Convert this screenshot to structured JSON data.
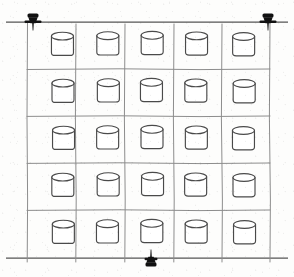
{
  "figure": {
    "kind": "technical-line-drawing",
    "background_color": "#fdfdfc",
    "ink_color": "#3a3a3a",
    "gridline_color": "#8d8d8d",
    "marker_color": "#111111",
    "canvas": {
      "width": 294,
      "height": 277
    }
  },
  "grid": {
    "rows": 5,
    "columns": 5,
    "cell_count": 25,
    "left": 27,
    "top": 22,
    "right": 270,
    "bottom": 258,
    "column_x": [
      27,
      76,
      125,
      174,
      222,
      270
    ],
    "row_y": [
      22,
      69,
      116,
      163,
      210,
      258
    ],
    "stroke_width": 1
  },
  "datum_lines": {
    "top_rule": {
      "x1": 6,
      "y1": 22,
      "x2": 288,
      "y2": 22,
      "label": "top datum line"
    },
    "bottom_rule": {
      "x1": 6,
      "y1": 258,
      "x2": 288,
      "y2": 258,
      "label": "bottom datum line"
    }
  },
  "markers": [
    {
      "id": "pin-top-left",
      "name": "thumbtack marker top left",
      "x": 33,
      "y": 22,
      "orientation": "down"
    },
    {
      "id": "pin-top-right",
      "name": "thumbtack marker top right",
      "x": 268,
      "y": 22,
      "orientation": "down"
    },
    {
      "id": "pin-bottom-center",
      "name": "thumbtack marker bottom center",
      "x": 151,
      "y": 258,
      "orientation": "up"
    }
  ],
  "cylinders": {
    "count": 25,
    "body_width": 22,
    "body_height": 19,
    "ellipse_ry": 4,
    "stroke_color": "#4a4a4a",
    "fill_color": "#ffffff",
    "positions": [
      {
        "row": 1,
        "col": 1,
        "cx": 63,
        "cy": 46
      },
      {
        "row": 1,
        "col": 2,
        "cx": 108,
        "cy": 45
      },
      {
        "row": 1,
        "col": 3,
        "cx": 152,
        "cy": 45
      },
      {
        "row": 1,
        "col": 4,
        "cx": 196,
        "cy": 45
      },
      {
        "row": 1,
        "col": 5,
        "cx": 244,
        "cy": 46
      },
      {
        "row": 2,
        "col": 1,
        "cx": 63,
        "cy": 93
      },
      {
        "row": 2,
        "col": 2,
        "cx": 108,
        "cy": 92
      },
      {
        "row": 2,
        "col": 3,
        "cx": 152,
        "cy": 92
      },
      {
        "row": 2,
        "col": 4,
        "cx": 196,
        "cy": 92
      },
      {
        "row": 2,
        "col": 5,
        "cx": 244,
        "cy": 93
      },
      {
        "row": 3,
        "col": 1,
        "cx": 63,
        "cy": 140
      },
      {
        "row": 3,
        "col": 2,
        "cx": 108,
        "cy": 139
      },
      {
        "row": 3,
        "col": 3,
        "cx": 152,
        "cy": 139
      },
      {
        "row": 3,
        "col": 4,
        "cx": 196,
        "cy": 139
      },
      {
        "row": 3,
        "col": 5,
        "cx": 244,
        "cy": 140
      },
      {
        "row": 4,
        "col": 1,
        "cx": 63,
        "cy": 187
      },
      {
        "row": 4,
        "col": 2,
        "cx": 108,
        "cy": 186
      },
      {
        "row": 4,
        "col": 3,
        "cx": 152,
        "cy": 186
      },
      {
        "row": 4,
        "col": 4,
        "cx": 196,
        "cy": 186
      },
      {
        "row": 4,
        "col": 5,
        "cx": 244,
        "cy": 187
      },
      {
        "row": 5,
        "col": 1,
        "cx": 63,
        "cy": 234
      },
      {
        "row": 5,
        "col": 2,
        "cx": 108,
        "cy": 233
      },
      {
        "row": 5,
        "col": 3,
        "cx": 152,
        "cy": 233
      },
      {
        "row": 5,
        "col": 4,
        "cx": 196,
        "cy": 233
      },
      {
        "row": 5,
        "col": 5,
        "cx": 244,
        "cy": 234
      }
    ]
  }
}
